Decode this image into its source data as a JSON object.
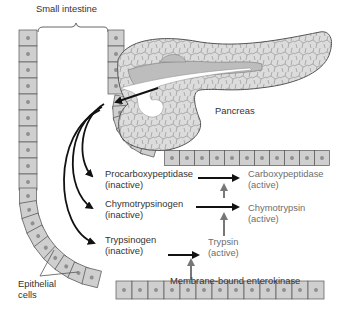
{
  "diagram": {
    "type": "biological-process",
    "colors": {
      "cell_fill": "#cfcfcf",
      "cell_border": "#555555",
      "nucleus": "#8f8f8f",
      "pancreas_fill": "#d9d9d9",
      "pancreas_duct": "#ffffff",
      "arrow_black": "#111111",
      "arrow_gray": "#777777",
      "text_dark": "#333333",
      "text_gray": "#6e6e6e"
    },
    "labels": {
      "small_intestine": "Small intestine",
      "pancreas": "Pancreas",
      "epithelial": [
        "Epithelial",
        "cells"
      ],
      "enterokinase": "Membrane-bound enterokinase"
    },
    "zymogens": [
      {
        "name": "Procarboxypeptidase",
        "state": "(inactive)",
        "active_name": "Carboxypeptidase",
        "active_state": "(active)"
      },
      {
        "name": "Chymotrypsinogen",
        "state": "(inactive)",
        "active_name": "Chymotrypsin",
        "active_state": "(active)"
      },
      {
        "name": "Trypsinogen",
        "state": "(inactive)",
        "active_name": "Trypsin",
        "active_state": "(active)"
      }
    ]
  }
}
